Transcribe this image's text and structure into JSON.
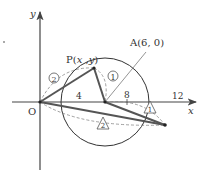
{
  "diagram": {
    "axes": {
      "x_label": "x",
      "y_label": "y",
      "origin_label": "O"
    },
    "ticks": [
      {
        "label": "4",
        "value": 4
      },
      {
        "label": "8",
        "value": 8
      },
      {
        "label": "12",
        "value": 12
      }
    ],
    "points": {
      "P": {
        "label_prefix": "P(",
        "x": "x",
        "sep": " ,",
        "y": "y",
        "suffix": ")"
      },
      "A": {
        "label": "A(6, 0)",
        "x": 6,
        "y": 0
      }
    },
    "circle": {
      "center": [
        6,
        0
      ],
      "radius": 6
    },
    "markers": {
      "circled_1": "①",
      "circled_2": "②",
      "triangle_1": "1",
      "triangle_2": "2"
    },
    "colors": {
      "line": "#444444",
      "thick": "#555555",
      "dashed": "#888888",
      "text": "#333333"
    }
  }
}
